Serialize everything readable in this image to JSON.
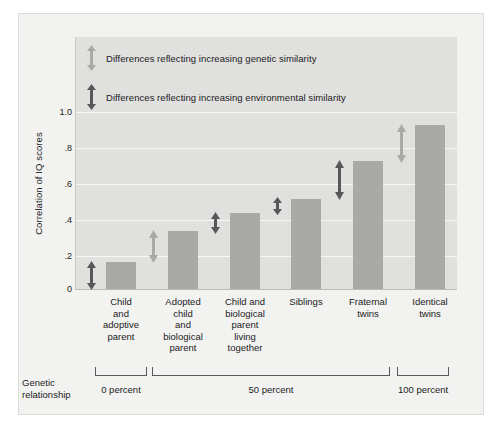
{
  "chart_data": {
    "type": "bar",
    "title": "",
    "xlabel": "",
    "ylabel": "Correlation of IQ scores",
    "ylim": [
      0,
      1.1
    ],
    "grid": true,
    "categories": [
      "Child and adoptive parent",
      "Adopted child and biological parent",
      "Child and biological parent living together",
      "Siblings",
      "Fraternal twins",
      "Identical twins"
    ],
    "values": [
      0.15,
      0.32,
      0.42,
      0.5,
      0.71,
      0.91
    ],
    "ytick_labels": [
      "1.0",
      ".8",
      ".6",
      ".4",
      ".2",
      "0"
    ],
    "ytick_values": [
      1.0,
      0.8,
      0.6,
      0.4,
      0.2,
      0
    ],
    "legend_position": "top-left",
    "legend": [
      {
        "key": "genetic",
        "label": "Differences reflecting increasing genetic similarity",
        "color": "#a9a9a5"
      },
      {
        "key": "environmental",
        "label": "Differences reflecting increasing environmental similarity",
        "color": "#58585a"
      }
    ],
    "annotations": [
      {
        "id": "arrow-1",
        "type": "environmental",
        "from": 0.0,
        "to": 0.15,
        "after_category": 0
      },
      {
        "id": "arrow-2",
        "type": "genetic",
        "from": 0.15,
        "to": 0.32,
        "after_category": 1
      },
      {
        "id": "arrow-3",
        "type": "environmental",
        "from": 0.32,
        "to": 0.42,
        "after_category": 2
      },
      {
        "id": "arrow-4",
        "type": "environmental",
        "from": 0.42,
        "to": 0.5,
        "after_category": 3
      },
      {
        "id": "arrow-5",
        "type": "environmental",
        "from": 0.5,
        "to": 0.71,
        "after_category": 4
      },
      {
        "id": "arrow-6",
        "type": "genetic",
        "from": 0.71,
        "to": 0.91,
        "after_category": 5
      }
    ]
  },
  "axis": {
    "y_label": "Correlation of IQ scores",
    "ticks": [
      {
        "label": "1.0",
        "value": 1.0
      },
      {
        "label": ".8",
        "value": 0.8
      },
      {
        "label": ".6",
        "value": 0.6
      },
      {
        "label": ".4",
        "value": 0.4
      },
      {
        "label": ".2",
        "value": 0.2
      },
      {
        "label": "0",
        "value": 0.0
      }
    ]
  },
  "categories": [
    {
      "label": "Child\nand\nadoptive\nparent",
      "value": 0.15
    },
    {
      "label": "Adopted\nchild\nand\nbiological\nparent",
      "value": 0.32
    },
    {
      "label": "Child and\nbiological\nparent\nliving\ntogether",
      "value": 0.42
    },
    {
      "label": "Siblings",
      "value": 0.5
    },
    {
      "label": "Fraternal\ntwins",
      "value": 0.71
    },
    {
      "label": "Identical\ntwins",
      "value": 0.91
    }
  ],
  "legend": {
    "genetic": "Differences reflecting increasing genetic similarity",
    "environmental": "Differences reflecting increasing environmental similarity"
  },
  "genetic_relationship": {
    "caption": "Genetic relationship",
    "groups": [
      {
        "label": "0 percent",
        "categories": [
          0
        ]
      },
      {
        "label": "50 percent",
        "categories": [
          1,
          2,
          3,
          4
        ]
      },
      {
        "label": "100 percent",
        "categories": [
          5
        ]
      }
    ]
  },
  "colors": {
    "bar": "#a9a9a5",
    "plot_background": "#e0e0de",
    "card_background": "#f2f2f0",
    "gridline": "#f7f7f5",
    "arrow_genetic": "#a9a9a5",
    "arrow_environmental": "#58585a",
    "text": "#1b1b1b",
    "bracket": "#58585a"
  }
}
